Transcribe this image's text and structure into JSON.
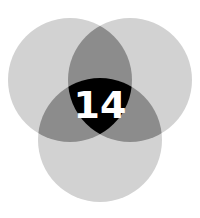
{
  "diagram": {
    "type": "venn-3",
    "center_label": "14",
    "colors": {
      "background": "#ffffff",
      "single_region": "#d2d2d2",
      "pair_overlap": "#8c8c8c",
      "triple_overlap": "#000000",
      "label": "#ffffff"
    },
    "circles": [
      {
        "id": "top-left",
        "cx": 70,
        "cy": 80,
        "r": 62
      },
      {
        "id": "top-right",
        "cx": 130,
        "cy": 80,
        "r": 62
      },
      {
        "id": "bottom",
        "cx": 100,
        "cy": 140,
        "r": 62
      }
    ]
  }
}
